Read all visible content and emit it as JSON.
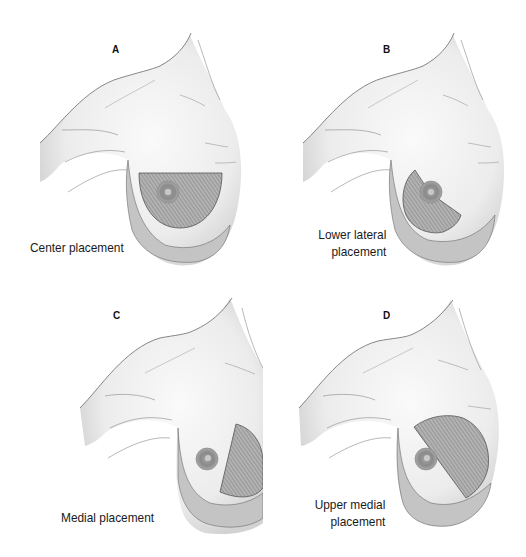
{
  "figure": {
    "panels": [
      {
        "id": "A",
        "letter": "A",
        "caption_lines": [
          "Center placement"
        ],
        "placement": "center"
      },
      {
        "id": "B",
        "letter": "B",
        "caption_lines": [
          "Lower lateral",
          "placement"
        ],
        "placement": "lower-lateral"
      },
      {
        "id": "C",
        "letter": "C",
        "caption_lines": [
          "Medial placement"
        ],
        "placement": "medial"
      },
      {
        "id": "D",
        "letter": "D",
        "caption_lines": [
          "Upper medial",
          "placement"
        ],
        "placement": "upper-medial"
      }
    ]
  },
  "colors": {
    "skin": "#f2f2f2",
    "shadow": "#c9c9c9",
    "outline": "#6a6a6a",
    "hatch_fill": "#a9a9a9",
    "hatch_line": "#7a7a7a",
    "inframammary_band": "#b8b8b8",
    "nipple": "#8c8c8c"
  }
}
